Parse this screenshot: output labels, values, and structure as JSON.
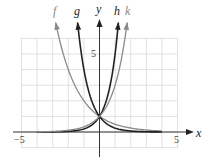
{
  "chart_data": {
    "type": "line",
    "title": "",
    "xlabel": "x",
    "ylabel": "y",
    "xlim": [
      -5,
      5
    ],
    "ylim": [
      -1,
      6
    ],
    "grid": true,
    "grid_step": 1,
    "x_ticks_labeled": [
      "−5",
      "5"
    ],
    "y_ticks_labeled": [
      "5"
    ],
    "legend": "curve labels at top of each curve",
    "intersection": {
      "x": 0,
      "y": 1
    },
    "series": [
      {
        "name": "f",
        "expr": "(1/2)^x",
        "base": 0.5,
        "color": "#8a8a8a",
        "x_start": -2.807,
        "x_end": 4,
        "points": [
          [
            -2.807,
            7
          ],
          [
            -2.5,
            5.66
          ],
          [
            -2,
            4
          ],
          [
            -1.5,
            2.83
          ],
          [
            -1,
            2
          ],
          [
            -0.5,
            1.41
          ],
          [
            0,
            1
          ],
          [
            0.5,
            0.71
          ],
          [
            1,
            0.5
          ],
          [
            2,
            0.25
          ],
          [
            3,
            0.125
          ],
          [
            4,
            0.0625
          ]
        ]
      },
      {
        "name": "g",
        "expr": "(1/4)^x",
        "base": 0.25,
        "color": "#222222",
        "x_start": -1.404,
        "x_end": 4,
        "points": [
          [
            -1.404,
            7
          ],
          [
            -1.25,
            5.66
          ],
          [
            -1,
            4
          ],
          [
            -0.75,
            2.83
          ],
          [
            -0.5,
            2
          ],
          [
            -0.25,
            1.41
          ],
          [
            0,
            1
          ],
          [
            0.5,
            0.5
          ],
          [
            1,
            0.25
          ],
          [
            2,
            0.0625
          ],
          [
            3,
            0.0156
          ],
          [
            4,
            0.0039
          ]
        ]
      },
      {
        "name": "h",
        "expr": "5^x",
        "base": 5,
        "color": "#222222",
        "x_start": -4,
        "x_end": 1.209,
        "points": [
          [
            -4,
            0.0016
          ],
          [
            -3,
            0.008
          ],
          [
            -2,
            0.04
          ],
          [
            -1,
            0.2
          ],
          [
            -0.5,
            0.447
          ],
          [
            0,
            1
          ],
          [
            0.25,
            1.5
          ],
          [
            0.5,
            2.236
          ],
          [
            0.75,
            3.34
          ],
          [
            1,
            5
          ],
          [
            1.209,
            7
          ]
        ]
      },
      {
        "name": "k",
        "expr": "3^x",
        "base": 3,
        "color": "#8a8a8a",
        "x_start": -4,
        "x_end": 1.771,
        "points": [
          [
            -4,
            0.012
          ],
          [
            -3,
            0.037
          ],
          [
            -2,
            0.111
          ],
          [
            -1,
            0.333
          ],
          [
            -0.5,
            0.577
          ],
          [
            0,
            1
          ],
          [
            0.5,
            1.73
          ],
          [
            1,
            3
          ],
          [
            1.5,
            5.2
          ],
          [
            1.771,
            7
          ]
        ]
      }
    ]
  },
  "labels": {
    "f": "f",
    "g": "g",
    "h": "h",
    "k": "k",
    "y_axis": "y",
    "x_axis": "x",
    "x_min_tick": "−5",
    "x_max_tick": "5",
    "y_tick": "5"
  },
  "colors": {
    "grid": "#d9d9d9",
    "axis": "#333333",
    "light_curve": "#8a8a8a",
    "dark_curve": "#222222"
  }
}
